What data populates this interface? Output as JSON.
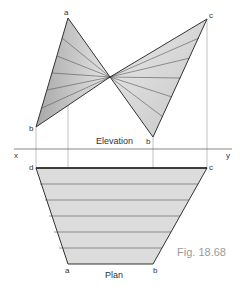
{
  "figure": {
    "caption": "Fig. 18.68",
    "elevation_label": "Elevation",
    "plan_label": "Plan",
    "xy_line": {
      "x_label": "x",
      "y_label": "y"
    },
    "elevation_points": {
      "a": "a",
      "c": "c",
      "b_left": "b",
      "b_right": "b"
    },
    "plan_points": {
      "d": "d",
      "c": "c",
      "a": "a",
      "b": "b"
    },
    "colors": {
      "fill_dark": "#b8b8b8",
      "fill_light": "#e2e2e2",
      "plan_fill": "#dcdcdc",
      "edge": "#333333",
      "construction": "#888888"
    }
  }
}
